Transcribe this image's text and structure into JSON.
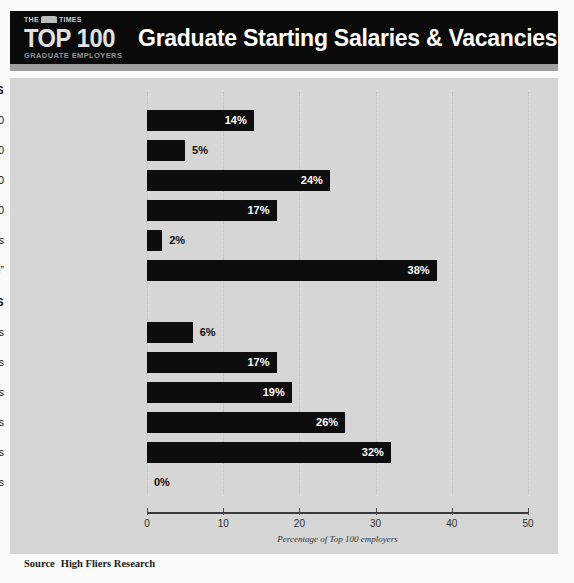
{
  "header": {
    "masthead": "THE TIMES",
    "brand_line1": "TOP 100",
    "brand_line2": "GRADUATE EMPLOYERS",
    "title": "Graduate Starting Salaries & Vacancies in 2013"
  },
  "sections": [
    {
      "heading": "SALARIES"
    },
    {
      "heading": "VACANCIES"
    }
  ],
  "source": {
    "label": "Source",
    "value": "High Fliers Research"
  },
  "colors": {
    "header_background": "#0a0a0a",
    "panel_background": "#d6d6d6",
    "bar": "#0d0d0d",
    "bar_label_inside": "#ffffff",
    "bar_label_outside": "#0d0d0d",
    "gridline": "#bdbdbd",
    "page_background": "#fbfbfb"
  },
  "chart_data": {
    "type": "bar",
    "title": "Graduate Starting Salaries & Vacancies in 2013",
    "subtitle": "",
    "orientation": "horizontal",
    "xlabel": "Percentage of Top 100 employers",
    "ylabel": "",
    "xlim": [
      0,
      50
    ],
    "xticks": [
      0,
      10,
      20,
      30,
      40,
      50
    ],
    "xtick_labels": [
      "0",
      "10",
      "20",
      "30",
      "40",
      "50"
    ],
    "grid": true,
    "legend": "none",
    "units": "%",
    "groups": [
      {
        "name": "SALARIES",
        "categories": [
          "More than £35,000",
          "£30,001-£35,000",
          "£25,001-£30,000",
          "£20,001-£25,000",
          "£20,000 or less",
          "“Competitive”"
        ],
        "values": [
          14,
          5,
          24,
          17,
          2,
          38
        ],
        "value_labels": [
          "14%",
          "5%",
          "24%",
          "17%",
          "2%",
          "38%"
        ]
      },
      {
        "name": "VACANCIES",
        "categories": [
          "More than 500 vacancies",
          "251-500 vacancies",
          "101-250 vacancies",
          "51-100 vacancies",
          "1-50 vacancies",
          "No vacancies"
        ],
        "values": [
          6,
          17,
          19,
          26,
          32,
          0
        ],
        "value_labels": [
          "6%",
          "17%",
          "19%",
          "26%",
          "32%",
          "0%"
        ]
      }
    ]
  }
}
